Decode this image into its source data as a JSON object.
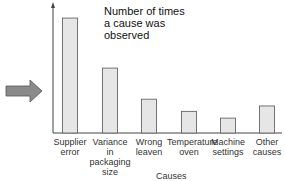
{
  "chart_data": {
    "type": "bar",
    "title": "Number of times a cause was observed",
    "title_lines": [
      "Number of times",
      "a cause was",
      "observed"
    ],
    "xlabel": "Causes",
    "ylabel": "",
    "categories": [
      "Supplier error",
      "Variance in packaging size",
      "Wrong leaven",
      "Temperature oven",
      "Machine settings",
      "Other causes"
    ],
    "category_lines": [
      [
        "Supplier",
        "error"
      ],
      [
        "Variance",
        "in",
        "packaging",
        "size"
      ],
      [
        "Wrong",
        "leaven"
      ],
      [
        "Temperature",
        "oven"
      ],
      [
        "Machine",
        "settings"
      ],
      [
        "Other",
        "causes"
      ]
    ],
    "values": [
      85,
      48,
      25,
      16,
      11,
      20
    ],
    "ylim": [
      0,
      100
    ],
    "grid": false,
    "legend": "none",
    "bar_color": "#e6e6e6",
    "bar_edge": "#666666",
    "annotation": "arrow pointing right at chart"
  }
}
